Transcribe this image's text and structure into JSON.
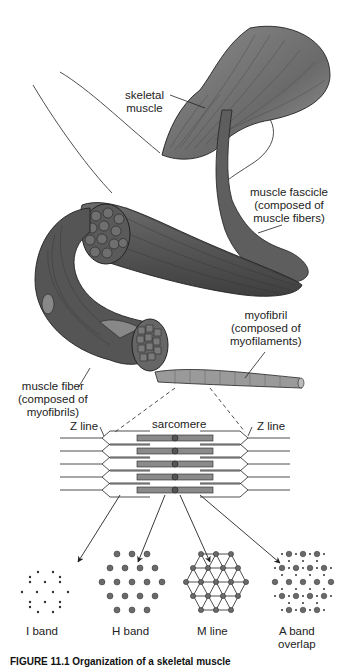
{
  "figure": {
    "caption": "FIGURE 11.1 Organization of a skeletal muscle",
    "colors": {
      "muscle_fill": "#6e6e6e",
      "muscle_dark": "#4a4a4a",
      "muscle_light": "#9a9a9a",
      "filament_fill": "#8a8a8a",
      "line": "#222222",
      "background": "#ffffff"
    }
  },
  "labels": {
    "skeletal_muscle": [
      "skeletal",
      "muscle"
    ],
    "muscle_fascicle": [
      "muscle fascicle",
      "(composed of",
      "muscle fibers)"
    ],
    "myofibril": [
      "myofibril",
      "(composed of",
      "myofilaments)"
    ],
    "muscle_fiber": [
      "muscle fiber",
      "(composed of",
      "myofibrils)"
    ],
    "sarcomere": "sarcomere",
    "z_line_left": "Z line",
    "z_line_right": "Z line"
  },
  "cross_sections": [
    {
      "label": [
        "I band"
      ],
      "pattern": "thin-filaments-only"
    },
    {
      "label": [
        "H band"
      ],
      "pattern": "thick-filaments-only"
    },
    {
      "label": [
        "M line"
      ],
      "pattern": "thick-filaments-linked"
    },
    {
      "label": [
        "A band",
        "overlap"
      ],
      "pattern": "thick-and-thin"
    }
  ]
}
